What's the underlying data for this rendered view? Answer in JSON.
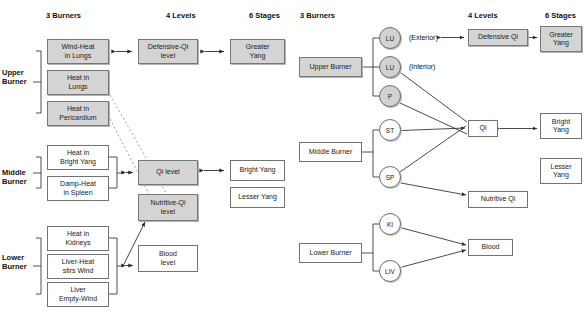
{
  "left_panel": {
    "headers": [
      {
        "text": "3 Burners",
        "x": 46,
        "y": 11
      },
      {
        "text": "4 Levels",
        "x": 166,
        "y": 11
      },
      {
        "text": "6 Stages",
        "x": 249,
        "y": 11
      }
    ],
    "side_labels": [
      {
        "text": "Upper\nBurner",
        "x": 2,
        "y": 68
      },
      {
        "text": "Middle\nBurner",
        "x": 2,
        "y": 168
      },
      {
        "text": "Lower\nBurner",
        "x": 2,
        "y": 253
      }
    ],
    "burner_boxes": [
      {
        "id": "wind-heat-in-lungs",
        "text": "Wind-Heat\nin Lungs",
        "style": "gray",
        "x": 47,
        "y": 39,
        "w": 62,
        "h": 25
      },
      {
        "id": "heat-in-lungs",
        "text": "Heat in\nLungs",
        "style": "gray",
        "x": 47,
        "y": 70,
        "w": 62,
        "h": 25
      },
      {
        "id": "heat-in-pericardium",
        "text": "Heat in\nPericardium",
        "style": "gray",
        "x": 47,
        "y": 101,
        "w": 62,
        "h": 25
      },
      {
        "id": "heat-in-bright-yang",
        "text": "Heat in\nBright Yang",
        "style": "white",
        "x": 47,
        "y": 145,
        "w": 62,
        "h": 25
      },
      {
        "id": "damp-heat-in-spleen",
        "text": "Damp-Heat\nin Spleen",
        "style": "white",
        "x": 47,
        "y": 176,
        "w": 62,
        "h": 25
      },
      {
        "id": "heat-in-kidneys",
        "text": "Heat in\nKidneys",
        "style": "white",
        "x": 47,
        "y": 226,
        "w": 62,
        "h": 25
      },
      {
        "id": "liver-heat-stirs-wind",
        "text": "Liver-Heat\nstirs Wind",
        "style": "white",
        "x": 47,
        "y": 254,
        "w": 62,
        "h": 25
      },
      {
        "id": "liver-empty-wind",
        "text": "Liver\nEmpty-Wind",
        "style": "white",
        "x": 47,
        "y": 282,
        "w": 62,
        "h": 25
      }
    ],
    "level_boxes": [
      {
        "id": "defensive-qi-level",
        "text": "Defensive-Qi\nlevel",
        "style": "gray",
        "x": 138,
        "y": 39,
        "w": 60,
        "h": 25
      },
      {
        "id": "qi-level",
        "text": "Qi level",
        "style": "gray",
        "x": 138,
        "y": 160,
        "w": 60,
        "h": 25
      },
      {
        "id": "nutritive-qi-level",
        "text": "Nutritive-Qi\nlevel",
        "style": "gray",
        "x": 138,
        "y": 194,
        "w": 60,
        "h": 27
      },
      {
        "id": "blood-level",
        "text": "Blood\nlevel",
        "style": "white",
        "x": 138,
        "y": 245,
        "w": 60,
        "h": 27
      }
    ],
    "stage_boxes": [
      {
        "id": "greater-yang",
        "text": "Greater\nYang",
        "style": "gray",
        "x": 230,
        "y": 39,
        "w": 55,
        "h": 25
      },
      {
        "id": "bright-yang",
        "text": "Bright Yang",
        "style": "white",
        "x": 230,
        "y": 160,
        "w": 55,
        "h": 21
      },
      {
        "id": "lesser-yang",
        "text": "Lesser Yang",
        "style": "white",
        "x": 230,
        "y": 187,
        "w": 55,
        "h": 21
      }
    ]
  },
  "right_panel": {
    "headers": [
      {
        "text": "3 Burners",
        "x": 300,
        "y": 11
      },
      {
        "text": "4 Levels",
        "x": 468,
        "y": 11
      },
      {
        "text": "6 Stages",
        "x": 545,
        "y": 11
      }
    ],
    "burner_boxes": [
      {
        "id": "upper-burner",
        "text": "Upper Burner",
        "style": "gray",
        "x": 299,
        "y": 57,
        "w": 63,
        "h": 20
      },
      {
        "id": "middle-burner",
        "text": "Middle Burner",
        "style": "white",
        "x": 299,
        "y": 142,
        "w": 63,
        "h": 20
      },
      {
        "id": "lower-burner",
        "text": "Lower Burner",
        "style": "white",
        "x": 299,
        "y": 243,
        "w": 63,
        "h": 20
      }
    ],
    "organ_circles": [
      {
        "id": "lu-exterior",
        "text": "LU",
        "style": "gray",
        "cx": 390,
        "cy": 38,
        "r": 11
      },
      {
        "id": "lu-interior",
        "text": "LU",
        "style": "gray",
        "cx": 390,
        "cy": 67,
        "r": 11
      },
      {
        "id": "p",
        "text": "P",
        "style": "gray",
        "cx": 390,
        "cy": 96,
        "r": 11
      },
      {
        "id": "st",
        "text": "ST",
        "style": "white",
        "cx": 390,
        "cy": 130,
        "r": 11
      },
      {
        "id": "sp",
        "text": "SP",
        "style": "white",
        "cx": 390,
        "cy": 177,
        "r": 11
      },
      {
        "id": "ki",
        "text": "KI",
        "style": "white",
        "cx": 390,
        "cy": 224,
        "r": 11
      },
      {
        "id": "liv",
        "text": "LIV",
        "style": "white",
        "cx": 390,
        "cy": 271,
        "r": 11
      }
    ],
    "annotations": [
      {
        "id": "exterior-note",
        "text": "(Exterior)",
        "x": 409,
        "y": 34
      },
      {
        "id": "interior-note",
        "text": "(Interior)",
        "x": 409,
        "y": 63
      }
    ],
    "level_boxes": [
      {
        "id": "defensive-qi",
        "text": "Defensive Qi",
        "style": "gray",
        "x": 468,
        "y": 29,
        "w": 60,
        "h": 17
      },
      {
        "id": "qi",
        "text": "Qi",
        "style": "white",
        "x": 468,
        "y": 120,
        "w": 30,
        "h": 17
      },
      {
        "id": "nutritive-qi",
        "text": "Nutritive Qi",
        "style": "white",
        "x": 468,
        "y": 191,
        "w": 60,
        "h": 17
      },
      {
        "id": "blood",
        "text": "Blood",
        "style": "white",
        "x": 468,
        "y": 239,
        "w": 45,
        "h": 17
      }
    ],
    "stage_boxes": [
      {
        "id": "greater-yang-r",
        "text": "Greater\nYang",
        "style": "gray",
        "x": 540,
        "y": 26,
        "w": 42,
        "h": 26
      },
      {
        "id": "bright-yang-r",
        "text": "Bright\nYang",
        "style": "white",
        "x": 540,
        "y": 113,
        "w": 42,
        "h": 26
      },
      {
        "id": "lesser-yang-r",
        "text": "Lesser\nYang",
        "style": "white",
        "x": 540,
        "y": 158,
        "w": 42,
        "h": 26
      }
    ]
  },
  "colors": {
    "gray_fill": "#d4d4d4",
    "white_fill": "#ffffff",
    "stroke": "#6e6e6e",
    "line": "#3a3a3a",
    "dashed": "#8a8a8a"
  }
}
